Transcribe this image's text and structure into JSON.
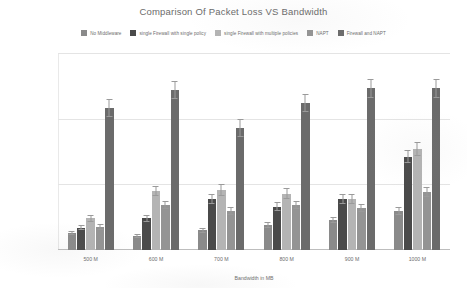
{
  "chart_data": {
    "type": "bar",
    "title": "Comparison Of Packet Loss VS Bandwidth",
    "xlabel": "Bandwidth in MB",
    "ylabel": "Percentage of Packet Loss",
    "categories": [
      "500 M",
      "600 M",
      "700 M",
      "800 M",
      "900 M",
      "1000 M"
    ],
    "ylim": [
      0,
      1.5
    ],
    "ytick_labels": [
      "0.000%",
      "0.500%",
      "1.000%",
      "1.500%"
    ],
    "ytick_values": [
      0,
      0.5,
      1.0,
      1.5
    ],
    "grid": true,
    "legend_position": "top",
    "units": "percent",
    "series": [
      {
        "name": "No Middleware",
        "color": "#8a8a8a",
        "values": [
          0.13,
          0.11,
          0.15,
          0.19,
          0.23,
          0.3
        ],
        "errors": [
          0.015,
          0.015,
          0.02,
          0.02,
          0.025,
          0.03
        ]
      },
      {
        "name": "single Firewall with single policy",
        "color": "#4a4a4a",
        "values": [
          0.17,
          0.24,
          0.39,
          0.33,
          0.39,
          0.71
        ],
        "errors": [
          0.02,
          0.025,
          0.04,
          0.035,
          0.04,
          0.05
        ]
      },
      {
        "name": "single Firewall with multiple policies",
        "color": "#b4b4b4",
        "values": [
          0.24,
          0.45,
          0.46,
          0.43,
          0.39,
          0.77
        ],
        "errors": [
          0.03,
          0.04,
          0.045,
          0.04,
          0.04,
          0.055
        ]
      },
      {
        "name": "NAPT",
        "color": "#949494",
        "values": [
          0.175,
          0.34,
          0.3,
          0.34,
          0.32,
          0.44
        ],
        "errors": [
          0.02,
          0.03,
          0.03,
          0.03,
          0.03,
          0.04
        ]
      },
      {
        "name": "Firewall and NAPT",
        "color": "#6b6b6b",
        "values": [
          1.08,
          1.22,
          0.93,
          1.12,
          1.23,
          1.23
        ],
        "errors": [
          0.07,
          0.07,
          0.07,
          0.07,
          0.07,
          0.07
        ]
      }
    ]
  }
}
